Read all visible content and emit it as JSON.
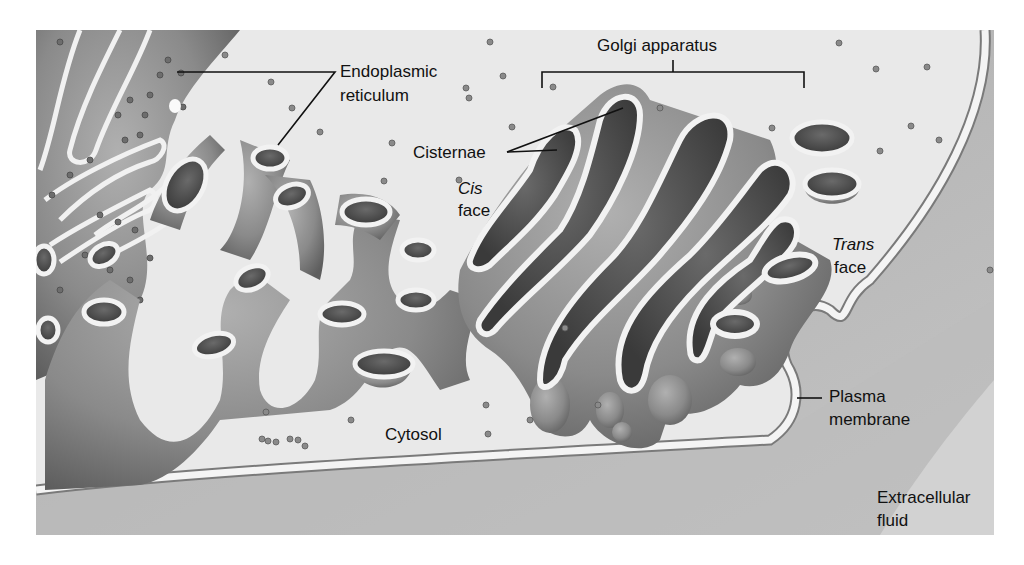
{
  "figure": {
    "colors": {
      "background": "#ffffff",
      "cytosol": "#e9e9e9",
      "organelle": "#8c8c8c",
      "organelle_dark": "#5a5a5a",
      "membrane": "#f2f2f2",
      "extracellular": "#b4b4b4",
      "label_text": "#111111"
    }
  },
  "labels": {
    "golgi": "Golgi apparatus",
    "er_line1": "Endoplasmic",
    "er_line2": "reticulum",
    "cisternae": "Cisternae",
    "cis_line1": "Cis",
    "cis_line2": "face",
    "trans_line1": "Trans",
    "trans_line2": "face",
    "plasma_line1": "Plasma",
    "plasma_line2": "membrane",
    "cytosol": "Cytosol",
    "extra_line1": "Extracellular",
    "extra_line2": "fluid"
  }
}
